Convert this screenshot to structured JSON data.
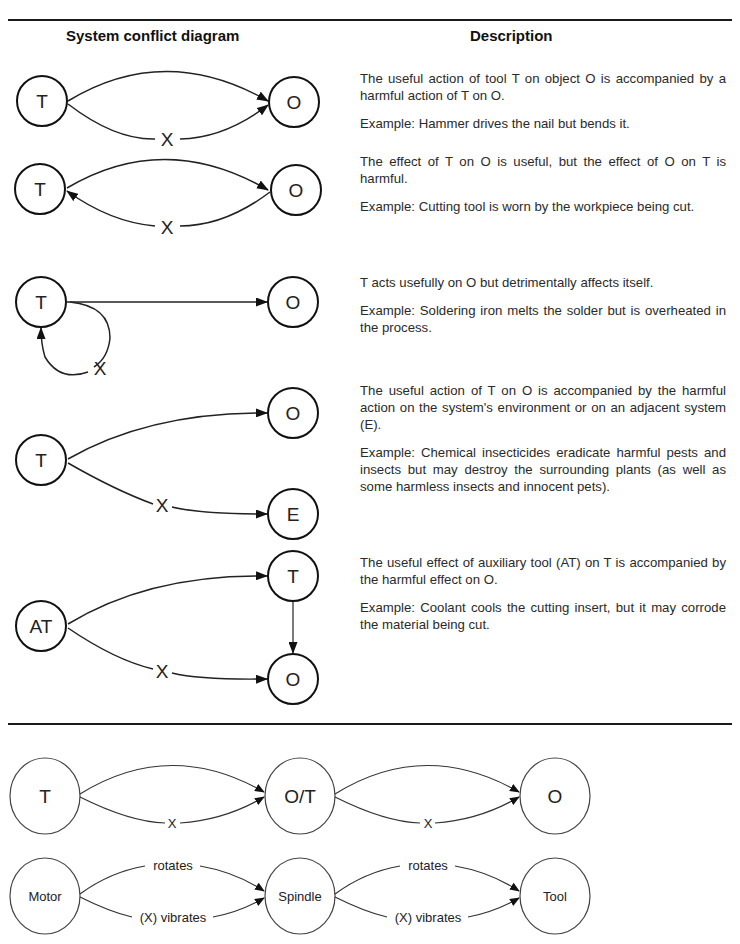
{
  "table": {
    "headers": {
      "diagram": "System conflict diagram",
      "description": "Description"
    },
    "rows": [
      {
        "nodes": [
          "T",
          "O"
        ],
        "harm_label": "X",
        "description": "The useful action of tool T on object O is accompanied by a harmful action of T on O.",
        "example": "Example: Hammer drives the nail but bends it."
      },
      {
        "nodes": [
          "T",
          "O"
        ],
        "harm_label": "X",
        "description": "The effect of T on O is useful, but the effect of O on T is harmful.",
        "example": "Example: Cutting tool is worn by the workpiece being cut."
      },
      {
        "nodes": [
          "T",
          "O"
        ],
        "harm_label": "X",
        "description": "T acts usefully on O but detrimentally affects itself.",
        "example": "Example: Soldering iron melts the solder but is overheated in the process."
      },
      {
        "nodes": [
          "T",
          "O",
          "E"
        ],
        "harm_label": "X",
        "description": "The useful action of T on O is accompanied by the harmful action on the system's environment or on an adjacent system (E).",
        "example": "Example: Chemical insecticides eradicate harmful pests and insects but may destroy the surrounding plants (as well as some harmless insects and innocent pets)."
      },
      {
        "nodes": [
          "AT",
          "T",
          "O"
        ],
        "harm_label": "X",
        "description": "The useful effect of auxiliary tool (AT) on T is accompanied by the harmful effect on O.",
        "example": "Example: Coolant cools the cutting insert, but it may corrode the material being cut."
      }
    ]
  },
  "chain": {
    "generic": {
      "nodes": [
        "T",
        "O/T",
        "O"
      ],
      "harm_label": "X"
    },
    "example": {
      "nodes": [
        "Motor",
        "Spindle",
        "Tool"
      ],
      "useful_label": "rotates",
      "harm_label": "(X) vibrates"
    }
  }
}
